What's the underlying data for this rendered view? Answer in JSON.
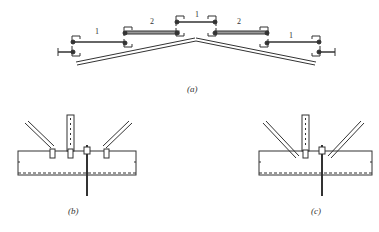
{
  "figure": {
    "panels": [
      {
        "id": "a",
        "caption": "(a)",
        "description": "Roof section with purlins and tie rods"
      },
      {
        "id": "b",
        "caption": "(b)",
        "description": "Tie rod connection detail"
      },
      {
        "id": "c",
        "caption": "(c)",
        "description": "Tie rod connection detail (variant)"
      }
    ],
    "rod_labels": [
      "1",
      "2",
      "1",
      "2",
      "1"
    ],
    "colors": {
      "line": "#333333",
      "background": "#ffffff",
      "rod_fill": "#999999"
    }
  }
}
